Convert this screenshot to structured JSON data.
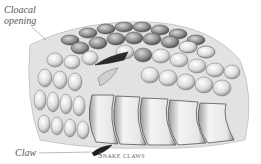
{
  "illustration": {
    "subject": "snake-body-scales-illustration",
    "caption": "Snake claws",
    "labels": {
      "cloacal": "Cloacal opening",
      "cloacal_line1": "Cloacal",
      "cloacal_line2": "opening",
      "claw": "Claw"
    }
  },
  "colors": {
    "background": "#ffffff",
    "ink_dark": "#333333",
    "ink_mid": "#888888",
    "ink_light": "#c8c8c8",
    "label_text": "#555555"
  }
}
